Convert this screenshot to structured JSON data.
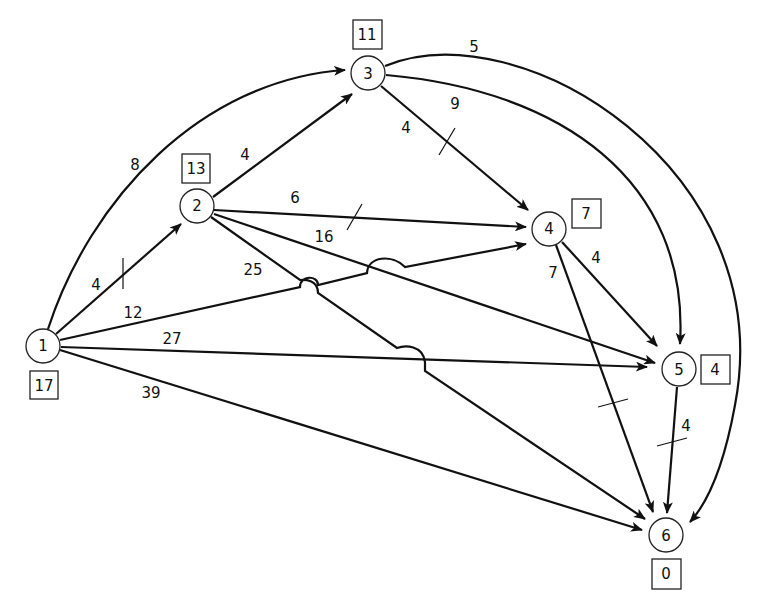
{
  "diagram": {
    "type": "directed-network",
    "nodes": [
      {
        "id": "1",
        "label": "1",
        "value": "17"
      },
      {
        "id": "2",
        "label": "2",
        "value": "13"
      },
      {
        "id": "3",
        "label": "3",
        "value": "11"
      },
      {
        "id": "4",
        "label": "4",
        "value": "7"
      },
      {
        "id": "5",
        "label": "5",
        "value": "4"
      },
      {
        "id": "6",
        "label": "6",
        "value": "0"
      }
    ],
    "edges": [
      {
        "from": "1",
        "to": "2",
        "weight": "4",
        "marked": true
      },
      {
        "from": "1",
        "to": "3",
        "weight": "8",
        "marked": false
      },
      {
        "from": "1",
        "to": "4",
        "weight": "12",
        "marked": false
      },
      {
        "from": "1",
        "to": "5",
        "weight": "27",
        "marked": false
      },
      {
        "from": "1",
        "to": "6",
        "weight": "39",
        "marked": false
      },
      {
        "from": "2",
        "to": "3",
        "weight": "4",
        "marked": false
      },
      {
        "from": "2",
        "to": "4",
        "weight": "6",
        "marked": true
      },
      {
        "from": "2",
        "to": "5",
        "weight": "16",
        "marked": false
      },
      {
        "from": "2",
        "to": "6",
        "weight": "25",
        "marked": false
      },
      {
        "from": "3",
        "to": "4",
        "weight": "4",
        "marked": true
      },
      {
        "from": "3",
        "to": "5",
        "weight": "9",
        "marked": false
      },
      {
        "from": "3",
        "to": "6",
        "weight": "5",
        "marked": false
      },
      {
        "from": "4",
        "to": "5",
        "weight": "4",
        "marked": false
      },
      {
        "from": "4",
        "to": "6",
        "weight": "7",
        "marked": true
      },
      {
        "from": "5",
        "to": "6",
        "weight": "4",
        "marked": true
      }
    ]
  }
}
